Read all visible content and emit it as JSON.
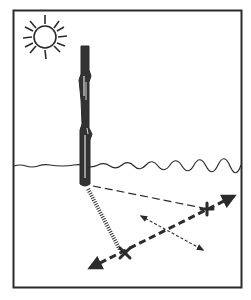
{
  "figure": {
    "colors": {
      "background": "#ffffff",
      "ink": "#2b2b2b",
      "stick": "#333333"
    },
    "elements": [
      {
        "name": "frame",
        "label": ""
      },
      {
        "name": "sun",
        "label": ""
      },
      {
        "name": "stick",
        "label": ""
      },
      {
        "name": "horizon",
        "label": ""
      },
      {
        "name": "shadow",
        "label": ""
      },
      {
        "name": "first-mark",
        "symbol": "x"
      },
      {
        "name": "second-mark",
        "symbol": "+"
      },
      {
        "name": "east-west-line",
        "label": ""
      },
      {
        "name": "north-south-line",
        "label": ""
      }
    ]
  }
}
